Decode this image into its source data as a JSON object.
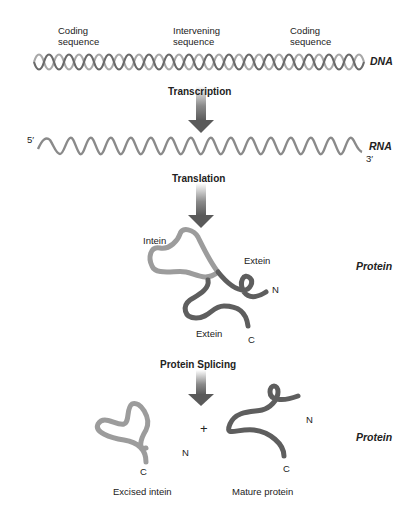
{
  "diagram": {
    "top_labels": [
      {
        "line1": "Coding",
        "line2": "sequence"
      },
      {
        "line1": "Intervening",
        "line2": "sequence"
      },
      {
        "line1": "Coding",
        "line2": "sequence"
      }
    ],
    "molecules": {
      "dna": "DNA",
      "rna": "RNA",
      "rna_5_prime": "5′",
      "rna_3_prime": "3′",
      "protein_1": "Protein",
      "protein_2": "Protein"
    },
    "steps": {
      "transcription": "Transcription",
      "translation": "Translation",
      "protein_splicing": "Protein Splicing"
    },
    "precursor_labels": {
      "intein": "Intein",
      "extein_top": "Extein",
      "extein_bottom": "Extein",
      "n_terminus": "N",
      "c_terminus": "C"
    },
    "products": {
      "plus": "+",
      "excised_intein": "Excised intein",
      "excised_n": "N",
      "excised_c": "C",
      "mature_protein": "Mature protein",
      "mature_n": "N",
      "mature_c": "C"
    },
    "colors": {
      "intein": "#9a9a9a",
      "extein": "#5e5e5e",
      "arrow": "#6a6a6a"
    }
  }
}
